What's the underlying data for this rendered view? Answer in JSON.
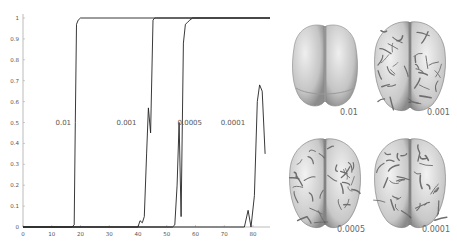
{
  "chart_data": {
    "type": "line",
    "title": "",
    "xlabel": "",
    "ylabel": "",
    "xlim": [
      0,
      87
    ],
    "ylim": [
      0,
      1
    ],
    "grid": false,
    "x_ticks": [
      0,
      10,
      20,
      30,
      40,
      50,
      60,
      70,
      80
    ],
    "y_ticks": [
      0,
      0.1,
      0.2,
      0.3,
      0.4,
      0.5,
      0.6,
      0.7,
      0.8,
      0.9,
      1
    ],
    "x_tick_labels": [
      "0",
      "10",
      "20",
      "30",
      "40",
      "50",
      "60",
      "70",
      "80"
    ],
    "y_tick_labels": [
      "0",
      "0.1",
      "0.2",
      "0.3",
      "0.4",
      "0.5",
      "0.6",
      "0.7",
      "0.8",
      "0.9",
      "1"
    ],
    "series": [
      {
        "name": "0.01",
        "label_pos": [
          14,
          0.5
        ],
        "x": [
          0,
          17,
          17.8,
          18.2,
          18.6,
          19.2,
          20,
          87
        ],
        "y": [
          0,
          0,
          0.01,
          0.5,
          0.97,
          0.99,
          1,
          1
        ]
      },
      {
        "name": "0.001",
        "label_pos": [
          36,
          0.5
        ],
        "x": [
          0,
          40,
          40.7,
          41.5,
          42.2,
          43,
          43.6,
          44.4,
          45.2,
          45.8,
          46.4,
          87
        ],
        "y": [
          0,
          0,
          0.03,
          0.02,
          0.05,
          0.35,
          0.57,
          0.45,
          0.99,
          1,
          1,
          1
        ]
      },
      {
        "name": "0.0005",
        "label_pos": [
          58,
          0.5
        ],
        "x": [
          0,
          52,
          52.8,
          53.6,
          54.3,
          55,
          55.8,
          56.5,
          57.3,
          58,
          59,
          60,
          87
        ],
        "y": [
          0,
          0,
          0.01,
          0.2,
          0.5,
          0.05,
          0.88,
          0.97,
          0.98,
          0.99,
          1,
          1,
          1
        ]
      },
      {
        "name": "0.0001",
        "label_pos": [
          73,
          0.5
        ],
        "x": [
          0,
          77,
          78.3,
          79.3,
          80.5,
          81.5,
          82.3,
          83.2,
          84.2
        ],
        "y": [
          0,
          0,
          0.08,
          0,
          0.15,
          0.6,
          0.68,
          0.65,
          0.35
        ]
      }
    ]
  },
  "brains": [
    {
      "label": "0.01",
      "style": "smooth"
    },
    {
      "label": "0.001",
      "style": "folded"
    },
    {
      "label": "0.0005",
      "style": "folded"
    },
    {
      "label": "0.0001",
      "style": "folded"
    }
  ]
}
